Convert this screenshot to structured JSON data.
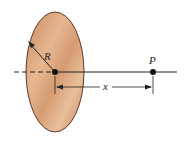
{
  "diagram": {
    "labels": {
      "radius": "R",
      "point": "P",
      "distance": "x"
    },
    "colors": {
      "disk_fill": "#d9a077",
      "disk_highlight": "#ecc4a2",
      "disk_edge": "#5a3a28",
      "line": "#222222"
    },
    "disk": {
      "cx": 55,
      "cy": 72,
      "rx": 29,
      "ry": 60
    },
    "point_P": {
      "x": 153,
      "y": 72
    },
    "axis": {
      "x1": 14,
      "x2": 177,
      "y": 72
    },
    "dimension": {
      "x1": 55,
      "x2": 153,
      "y": 87
    }
  }
}
